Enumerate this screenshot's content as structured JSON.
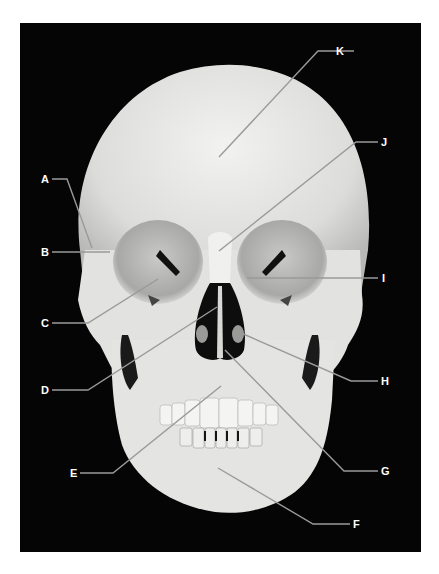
{
  "figure": {
    "background_color": "#050505",
    "bone_color": "#e6e6e4",
    "leader_line_color": "#9a9a9a",
    "label_color": "#ffffff"
  },
  "labels": [
    {
      "id": "A",
      "text": "A",
      "side": "left"
    },
    {
      "id": "B",
      "text": "B",
      "side": "left"
    },
    {
      "id": "C",
      "text": "C",
      "side": "left"
    },
    {
      "id": "D",
      "text": "D",
      "side": "left"
    },
    {
      "id": "E",
      "text": "E",
      "side": "left"
    },
    {
      "id": "F",
      "text": "F",
      "side": "right"
    },
    {
      "id": "G",
      "text": "G",
      "side": "right"
    },
    {
      "id": "H",
      "text": "H",
      "side": "right"
    },
    {
      "id": "I",
      "text": "I",
      "side": "right"
    },
    {
      "id": "J",
      "text": "J",
      "side": "right"
    },
    {
      "id": "K",
      "text": "K",
      "side": "right"
    }
  ]
}
